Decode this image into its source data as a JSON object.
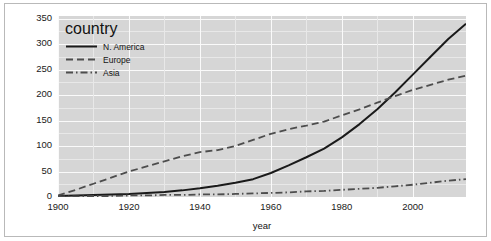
{
  "chart_data": {
    "type": "line",
    "title": "",
    "xlabel": "year",
    "ylabel": "",
    "xlim": [
      1900,
      2015
    ],
    "ylim": [
      0,
      355
    ],
    "grid": true,
    "legend_position": "top-left",
    "legend_title": "country",
    "xticks": [
      1900,
      1920,
      1940,
      1960,
      1980,
      2000
    ],
    "yticks": [
      0,
      50,
      100,
      150,
      200,
      250,
      300,
      350
    ],
    "xtick_labels": [
      "1900",
      "1920",
      "1940",
      "1960",
      "1980",
      "2000"
    ],
    "ytick_labels": [
      "0",
      "50",
      "100",
      "150",
      "200",
      "250",
      "300",
      "350"
    ],
    "x": [
      1900,
      1905,
      1910,
      1915,
      1920,
      1925,
      1930,
      1935,
      1940,
      1945,
      1950,
      1955,
      1960,
      1965,
      1970,
      1975,
      1980,
      1985,
      1990,
      1995,
      2000,
      2005,
      2010,
      2015
    ],
    "series": [
      {
        "name": "N. America",
        "style": "solid",
        "color": "#1a1a1a",
        "values": [
          2,
          3,
          4,
          5,
          6,
          8,
          10,
          13,
          17,
          22,
          28,
          35,
          47,
          62,
          78,
          95,
          117,
          143,
          172,
          205,
          240,
          275,
          310,
          340
        ]
      },
      {
        "name": "Europe",
        "style": "dashed",
        "color": "#4d4d4d",
        "values": [
          3,
          14,
          26,
          38,
          50,
          60,
          70,
          80,
          88,
          92,
          100,
          112,
          124,
          133,
          140,
          148,
          160,
          172,
          185,
          198,
          210,
          220,
          230,
          238
        ]
      },
      {
        "name": "Asia",
        "style": "dashdot",
        "color": "#4d4d4d",
        "values": [
          1,
          1,
          2,
          2,
          3,
          3,
          4,
          4,
          5,
          5,
          6,
          7,
          8,
          9,
          11,
          12,
          14,
          16,
          18,
          21,
          24,
          28,
          32,
          35
        ]
      }
    ]
  },
  "style": {
    "panel_background": "#d6d6d6",
    "gridline_major_color": "#fafafa",
    "gridline_minor_color": "#e8e8e8",
    "figure_background": "#ffffff",
    "frame_border_color": "#b9b9b9",
    "text_color": "#141414"
  }
}
